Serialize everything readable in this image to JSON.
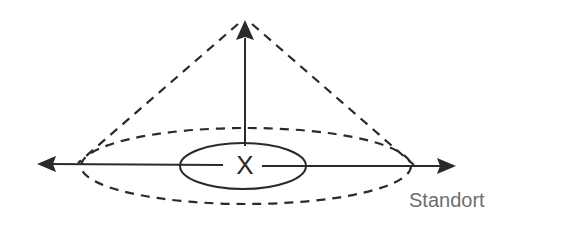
{
  "diagram": {
    "type": "3d-axes-cone",
    "labels": {
      "location": "Standort",
      "center_marker": "X"
    },
    "colors": {
      "stroke": "#2a2a2a",
      "label": "#6e6e6e",
      "background": "#ffffff"
    },
    "elements": [
      {
        "name": "vertical-axis-arrow",
        "style": "solid",
        "direction": "up"
      },
      {
        "name": "horizontal-axis-arrow-left",
        "style": "solid",
        "direction": "left"
      },
      {
        "name": "horizontal-axis-arrow-right",
        "style": "solid",
        "direction": "right"
      },
      {
        "name": "cone-edge-left",
        "style": "dashed"
      },
      {
        "name": "cone-edge-right",
        "style": "dashed"
      },
      {
        "name": "outer-ellipse",
        "style": "dashed"
      },
      {
        "name": "inner-ellipse",
        "style": "solid"
      },
      {
        "name": "center-marker",
        "style": "cross"
      }
    ]
  }
}
